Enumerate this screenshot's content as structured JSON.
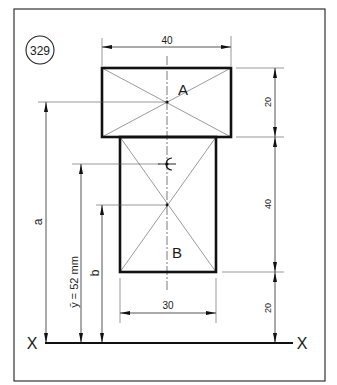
{
  "figure": {
    "number": "329",
    "colors": {
      "ink": "#111111",
      "paper": "#ffffff"
    }
  },
  "shapes": {
    "top_rectangle": {
      "label": "A",
      "width": "40",
      "height": "20"
    },
    "bottom_rectangle": {
      "label": "B",
      "width": "30",
      "height": "40"
    },
    "centroid_marker": "centroid-symbol"
  },
  "dimensions": {
    "top_width": "40",
    "bottom_width": "30",
    "right_top": "20",
    "right_middle": "40",
    "right_bottom": "20",
    "left_a": "a",
    "left_ybar": "ȳ = 52 mm",
    "left_b": "b"
  },
  "baseline": {
    "left_label": "X",
    "right_label": "X"
  }
}
